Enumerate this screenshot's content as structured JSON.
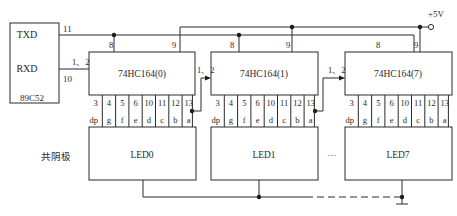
{
  "mcu": {
    "label": "89C52",
    "pins": [
      {
        "name": "TXD",
        "number": "11"
      },
      {
        "name": "RXD",
        "number": "10"
      }
    ]
  },
  "power": {
    "label": "+5V"
  },
  "chips": [
    {
      "label": "74HC164(0)",
      "clk_pin": "8",
      "clr_pin": "9",
      "data_pin": "1、2"
    },
    {
      "label": "74HC164(1)",
      "clk_pin": "8",
      "clr_pin": "9",
      "data_pin": "1、2"
    },
    {
      "label": "74HC164(7)",
      "clk_pin": "8",
      "clr_pin": "9",
      "data_pin": "1、2"
    }
  ],
  "output_pins": [
    "3",
    "4",
    "5",
    "6",
    "10",
    "11",
    "12",
    "13"
  ],
  "segments": [
    "dp",
    "g",
    "f",
    "e",
    "d",
    "c",
    "b",
    "a"
  ],
  "leds": [
    {
      "label": "LED0"
    },
    {
      "label": "LED1"
    },
    {
      "label": "LED7"
    }
  ],
  "common_label": "共阴极",
  "ellipsis": "···"
}
